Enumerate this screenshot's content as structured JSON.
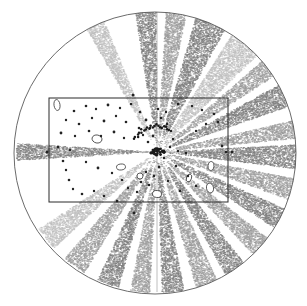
{
  "figure": {
    "type": "scanned-astronomical-plate",
    "canvas": {
      "width": 307,
      "height": 306,
      "background": "#ffffff"
    }
  },
  "field_circle": {
    "label": "field-boundary-circle",
    "cx": 155,
    "cy": 153,
    "r": 141,
    "stroke": "#5a5a5a",
    "stroke_width": 0.9,
    "fill": "none"
  },
  "frame_rect": {
    "label": "survey-frame-rectangle",
    "x": 49,
    "y": 98,
    "width": 179,
    "height": 104,
    "stroke": "#2b2b2b",
    "stroke_width": 1.0
  },
  "convergence_point": {
    "label": "radiant-center",
    "x": 157,
    "y": 152
  },
  "axes": [
    {
      "name": "horizontal-axis",
      "x1": 16,
      "y1": 152,
      "x2": 295,
      "y2": 152
    },
    {
      "name": "vertical-axis",
      "x1": 157,
      "y1": 12,
      "x2": 157,
      "y2": 292
    }
  ],
  "stipple": {
    "color_dark": "#7d7d7d",
    "color_mid": "#9a9a9a",
    "color_light": "#bdbdbd",
    "density": 0.55
  },
  "chart_data": {
    "type": "scatter",
    "xlabel": "",
    "ylabel": "",
    "grid": false,
    "legend": "none",
    "xlim": [
      0,
      307
    ],
    "ylim": [
      0,
      306
    ],
    "bands": [
      {
        "id": "b01",
        "angle_start": -99.0,
        "angle_end": -90.5,
        "r_inner": 6,
        "r_outer": 141,
        "shade": "dark"
      },
      {
        "id": "b02",
        "angle_start": -86.5,
        "angle_end": -78.0,
        "r_inner": 6,
        "r_outer": 141,
        "shade": "mid"
      },
      {
        "id": "b03",
        "angle_start": -74.0,
        "angle_end": -61.0,
        "r_inner": 6,
        "r_outer": 141,
        "shade": "dark"
      },
      {
        "id": "b04",
        "angle_start": -57.5,
        "angle_end": -44.0,
        "r_inner": 6,
        "r_outer": 141,
        "shade": "light"
      },
      {
        "id": "b05",
        "angle_start": -41.0,
        "angle_end": -33.0,
        "r_inner": 6,
        "r_outer": 141,
        "shade": "mid"
      },
      {
        "id": "b06",
        "angle_start": -29.0,
        "angle_end": -19.0,
        "r_inner": 6,
        "r_outer": 141,
        "shade": "dark"
      },
      {
        "id": "b07",
        "angle_start": -13.0,
        "angle_end": -5.5,
        "r_inner": 6,
        "r_outer": 141,
        "shade": "mid"
      },
      {
        "id": "b08",
        "angle_start": -3.0,
        "angle_end": 7.0,
        "r_inner": 6,
        "r_outer": 141,
        "shade": "dark"
      },
      {
        "id": "b09",
        "angle_start": 11.0,
        "angle_end": 20.0,
        "r_inner": 6,
        "r_outer": 141,
        "shade": "mid"
      },
      {
        "id": "b10",
        "angle_start": 24.0,
        "angle_end": 33.0,
        "r_inner": 6,
        "r_outer": 141,
        "shade": "dark"
      },
      {
        "id": "b11",
        "angle_start": 38.0,
        "angle_end": 47.0,
        "r_inner": 6,
        "r_outer": 141,
        "shade": "mid"
      },
      {
        "id": "b12",
        "angle_start": 52.0,
        "angle_end": 61.0,
        "r_inner": 6,
        "r_outer": 141,
        "shade": "dark"
      },
      {
        "id": "b13",
        "angle_start": 65.0,
        "angle_end": 74.0,
        "r_inner": 6,
        "r_outer": 141,
        "shade": "mid"
      },
      {
        "id": "b14",
        "angle_start": 79.0,
        "angle_end": 88.0,
        "r_inner": 6,
        "r_outer": 141,
        "shade": "dark"
      },
      {
        "id": "b15",
        "angle_start": 93.0,
        "angle_end": 101.0,
        "r_inner": 6,
        "r_outer": 141,
        "shade": "mid"
      },
      {
        "id": "b16",
        "angle_start": 106.0,
        "angle_end": 115.0,
        "r_inner": 6,
        "r_outer": 141,
        "shade": "dark"
      },
      {
        "id": "b17",
        "angle_start": 121.0,
        "angle_end": 131.0,
        "r_inner": 6,
        "r_outer": 141,
        "shade": "mid"
      },
      {
        "id": "b18",
        "angle_start": 137.0,
        "angle_end": 147.0,
        "r_inner": 6,
        "r_outer": 141,
        "shade": "light"
      },
      {
        "id": "b19",
        "angle_start": 176.5,
        "angle_end": 183.5,
        "r_inner": 6,
        "r_outer": 141,
        "shade": "dark"
      },
      {
        "id": "b20",
        "angle_start": -120.0,
        "angle_end": -112.0,
        "r_inner": 6,
        "r_outer": 141,
        "shade": "light"
      }
    ],
    "points": [
      {
        "x": 74,
        "y": 111,
        "r": 1.3
      },
      {
        "x": 86,
        "y": 106,
        "r": 1.3
      },
      {
        "x": 96,
        "y": 109,
        "r": 1.2
      },
      {
        "x": 108,
        "y": 105,
        "r": 1.4
      },
      {
        "x": 120,
        "y": 108,
        "r": 1.2
      },
      {
        "x": 131,
        "y": 104,
        "r": 1.3
      },
      {
        "x": 66,
        "y": 120,
        "r": 1.2
      },
      {
        "x": 79,
        "y": 124,
        "r": 1.3
      },
      {
        "x": 92,
        "y": 118,
        "r": 1.2
      },
      {
        "x": 104,
        "y": 121,
        "r": 1.4
      },
      {
        "x": 116,
        "y": 116,
        "r": 1.2
      },
      {
        "x": 126,
        "y": 122,
        "r": 1.3
      },
      {
        "x": 61,
        "y": 133,
        "r": 1.4
      },
      {
        "x": 75,
        "y": 136,
        "r": 1.2
      },
      {
        "x": 89,
        "y": 131,
        "r": 1.3
      },
      {
        "x": 101,
        "y": 136,
        "r": 1.2
      },
      {
        "x": 114,
        "y": 132,
        "r": 1.4
      },
      {
        "x": 124,
        "y": 138,
        "r": 1.2
      },
      {
        "x": 58,
        "y": 147,
        "r": 1.3
      },
      {
        "x": 70,
        "y": 150,
        "r": 1.2
      },
      {
        "x": 63,
        "y": 161,
        "r": 1.3
      },
      {
        "x": 66,
        "y": 170,
        "r": 1.2
      },
      {
        "x": 69,
        "y": 180,
        "r": 1.3
      },
      {
        "x": 73,
        "y": 189,
        "r": 1.2
      },
      {
        "x": 82,
        "y": 194,
        "r": 1.3
      },
      {
        "x": 94,
        "y": 191,
        "r": 1.2
      },
      {
        "x": 104,
        "y": 196,
        "r": 1.3
      },
      {
        "x": 98,
        "y": 168,
        "r": 1.4
      },
      {
        "x": 112,
        "y": 173,
        "r": 1.2
      },
      {
        "x": 122,
        "y": 180,
        "r": 1.3
      },
      {
        "x": 128,
        "y": 188,
        "r": 1.2
      },
      {
        "x": 86,
        "y": 162,
        "r": 1.2
      },
      {
        "x": 133,
        "y": 95,
        "r": 1.5
      },
      {
        "x": 140,
        "y": 112,
        "r": 1.3
      },
      {
        "x": 146,
        "y": 120,
        "r": 1.4
      },
      {
        "x": 150,
        "y": 128,
        "r": 1.3
      },
      {
        "x": 153,
        "y": 136,
        "r": 1.4
      },
      {
        "x": 148,
        "y": 142,
        "r": 1.3
      },
      {
        "x": 143,
        "y": 135,
        "r": 1.2
      },
      {
        "x": 139,
        "y": 128,
        "r": 1.3
      },
      {
        "x": 161,
        "y": 118,
        "r": 1.3
      },
      {
        "x": 167,
        "y": 124,
        "r": 1.2
      },
      {
        "x": 171,
        "y": 131,
        "r": 1.3
      },
      {
        "x": 173,
        "y": 139,
        "r": 1.2
      },
      {
        "x": 166,
        "y": 112,
        "r": 1.2
      },
      {
        "x": 158,
        "y": 109,
        "r": 1.3
      },
      {
        "x": 170,
        "y": 147,
        "r": 1.3
      },
      {
        "x": 178,
        "y": 151,
        "r": 1.2
      },
      {
        "x": 186,
        "y": 153,
        "r": 1.3
      },
      {
        "x": 164,
        "y": 158,
        "r": 1.2
      },
      {
        "x": 159,
        "y": 167,
        "r": 1.3
      },
      {
        "x": 154,
        "y": 176,
        "r": 1.2
      },
      {
        "x": 149,
        "y": 185,
        "r": 1.3
      },
      {
        "x": 146,
        "y": 172,
        "r": 1.2
      },
      {
        "x": 141,
        "y": 182,
        "r": 1.3
      },
      {
        "x": 137,
        "y": 192,
        "r": 1.2
      },
      {
        "x": 176,
        "y": 166,
        "r": 1.3
      },
      {
        "x": 188,
        "y": 176,
        "r": 1.2
      },
      {
        "x": 196,
        "y": 186,
        "r": 1.3
      },
      {
        "x": 168,
        "y": 181,
        "r": 1.2
      },
      {
        "x": 180,
        "y": 191,
        "r": 1.3
      },
      {
        "x": 202,
        "y": 110,
        "r": 1.2
      },
      {
        "x": 214,
        "y": 114,
        "r": 1.3
      },
      {
        "x": 192,
        "y": 106,
        "r": 1.2
      },
      {
        "x": 178,
        "y": 104,
        "r": 1.3
      },
      {
        "x": 206,
        "y": 124,
        "r": 1.2
      },
      {
        "x": 218,
        "y": 122,
        "r": 1.3
      },
      {
        "x": 196,
        "y": 131,
        "r": 1.2
      },
      {
        "x": 222,
        "y": 146,
        "r": 1.4
      },
      {
        "x": 226,
        "y": 152,
        "r": 1.3
      },
      {
        "x": 134,
        "y": 213,
        "r": 1.4
      },
      {
        "x": 47,
        "y": 152,
        "r": 1.5
      },
      {
        "x": 232,
        "y": 152,
        "r": 1.4
      },
      {
        "x": 117,
        "y": 201,
        "r": 1.3
      }
    ],
    "blobs": [
      {
        "x": 57,
        "y": 105,
        "w": 6,
        "h": 11,
        "rot": -8
      },
      {
        "x": 97,
        "y": 139,
        "w": 10,
        "h": 8,
        "rot": 12
      },
      {
        "x": 121,
        "y": 167,
        "w": 9,
        "h": 6,
        "rot": -5
      },
      {
        "x": 157,
        "y": 194,
        "w": 9,
        "h": 7,
        "rot": 6
      },
      {
        "x": 211,
        "y": 166,
        "w": 6,
        "h": 9,
        "rot": 10
      },
      {
        "x": 210,
        "y": 188,
        "w": 7,
        "h": 10,
        "rot": -12
      },
      {
        "x": 140,
        "y": 176,
        "w": 6,
        "h": 6,
        "rot": 0
      },
      {
        "x": 189,
        "y": 178,
        "w": 5,
        "h": 8,
        "rot": 20
      }
    ]
  }
}
